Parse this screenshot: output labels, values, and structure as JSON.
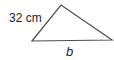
{
  "diagram": {
    "shape": "triangle",
    "vertices": [
      [
        32,
        41
      ],
      [
        61,
        5
      ],
      [
        112,
        40
      ]
    ],
    "stroke_color": "#4d4d4f",
    "labels": {
      "side": "32 cm",
      "base": "b"
    }
  }
}
